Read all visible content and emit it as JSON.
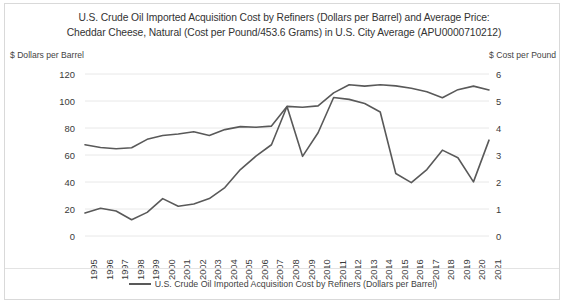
{
  "chart_data": {
    "type": "line",
    "title": "U.S. Crude Oil Imported Acquisition Cost by Refiners (Dollars per Barrel) and Average Price: Cheddar Cheese, Natural (Cost per Pound/453.6 Grams) in U.S. City Average (APU0000710212)",
    "title_lines": [
      "U.S. Crude Oil Imported Acquisition Cost by Refiners (Dollars per Barrel) and Average Price:",
      "Cheddar Cheese, Natural (Cost per Pound/453.6 Grams) in U.S. City Average (APU0000710212)"
    ],
    "xlabel": "",
    "ylabel": "$ Dollars per Barrel",
    "y2label": "$ Cost per Pound",
    "ylim": [
      0,
      120
    ],
    "y2lim": [
      0,
      6
    ],
    "yticks": [
      0,
      20,
      40,
      60,
      80,
      100,
      120
    ],
    "y2ticks": [
      0,
      1,
      2,
      3,
      4,
      5,
      6
    ],
    "grid": true,
    "legend_position": "bottom",
    "categories": [
      "1995",
      "1996",
      "1997",
      "1998",
      "1999",
      "2000",
      "2001",
      "2002",
      "2003",
      "2004",
      "2005",
      "2006",
      "2007",
      "2008",
      "2009",
      "2010",
      "2011",
      "2012",
      "2013",
      "2014",
      "2015",
      "2016",
      "2017",
      "2018",
      "2019",
      "2020",
      "2021"
    ],
    "series": [
      {
        "name": "U.S. Crude Oil Imported Acquisition Cost by Refiners (Dollars per Barrel)",
        "axis": "left",
        "color": "#595959",
        "values": [
          17.1,
          20.6,
          18.5,
          12.0,
          17.5,
          27.7,
          22.0,
          23.7,
          27.7,
          35.9,
          49.2,
          59.1,
          67.6,
          95.9,
          59.0,
          76.5,
          102.6,
          101.2,
          98.1,
          91.9,
          46.3,
          39.5,
          49.2,
          63.6,
          58.0,
          40.1,
          71.0
        ]
      },
      {
        "name": "Average Price: Cheddar Cheese, Natural (Cost per Pound/453.6 Grams) in U.S. City Average (APU0000710212)",
        "axis": "right",
        "color": "#595959",
        "values": [
          3.38,
          3.28,
          3.23,
          3.27,
          3.58,
          3.72,
          3.78,
          3.86,
          3.72,
          3.94,
          4.05,
          4.03,
          4.07,
          4.8,
          4.77,
          4.82,
          5.3,
          5.6,
          5.55,
          5.6,
          5.56,
          5.47,
          5.34,
          5.12,
          5.42,
          5.55,
          5.41
        ]
      }
    ],
    "legend": [
      "U.S. Crude Oil Imported Acquisition Cost by Refiners (Dollars per Barrel)"
    ]
  }
}
